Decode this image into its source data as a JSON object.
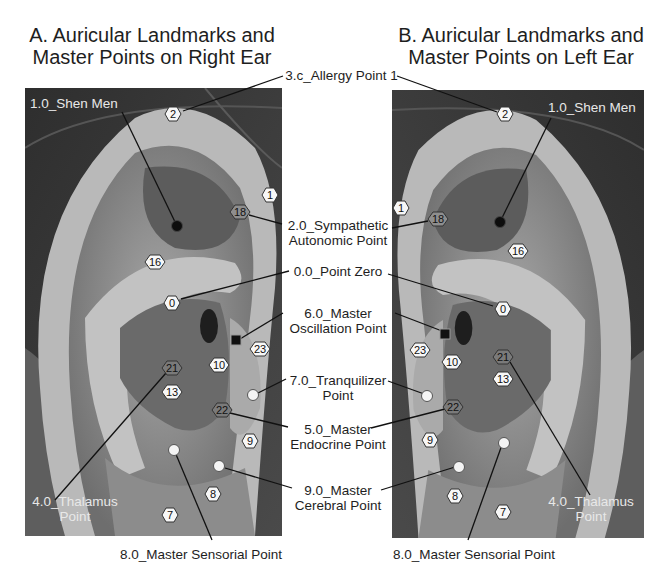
{
  "titles": {
    "a_line1": "A. Auricular Landmarks and",
    "a_line2": "Master Points on Right Ear",
    "b_line1": "B. Auricular Landmarks and",
    "b_line2": "Master Points on Left Ear"
  },
  "center_labels": {
    "allergy": "3.c_Allergy Point 1",
    "sympathetic_1": "2.0_Sympathetic",
    "sympathetic_2": "Autonomic Point",
    "point_zero": "0.0_Point Zero",
    "oscillation_1": "6.0_Master",
    "oscillation_2": "Oscillation Point",
    "tranquilizer_1": "7.0_Tranquilizer",
    "tranquilizer_2": "Point",
    "endocrine_1": "5.0_Master",
    "endocrine_2": "Endocrine Point",
    "cerebral_1": "9.0_Master",
    "cerebral_2": "Cerebral Point"
  },
  "panel_a": {
    "shen_men": "1.0_Shen Men",
    "thalamus_1": "4.0_Thalamus",
    "thalamus_2": "Point",
    "sensorial": "8.0_Master Sensorial Point"
  },
  "panel_b": {
    "shen_men": "1.0_Shen Men",
    "thalamus_1": "4.0_Thalamus",
    "thalamus_2": "Point",
    "sensorial": "8.0_Master Sensorial Point"
  },
  "hex_markers_a": [
    {
      "n": "2",
      "x": 173,
      "y": 114,
      "style": "light"
    },
    {
      "n": "1",
      "x": 270,
      "y": 195,
      "style": "light"
    },
    {
      "n": "18",
      "x": 240,
      "y": 212,
      "style": "dark"
    },
    {
      "n": "16",
      "x": 155,
      "y": 262,
      "style": "light"
    },
    {
      "n": "0",
      "x": 172,
      "y": 303,
      "style": "light"
    },
    {
      "n": "23",
      "x": 260,
      "y": 349,
      "style": "light"
    },
    {
      "n": "10",
      "x": 219,
      "y": 365,
      "style": "light"
    },
    {
      "n": "21",
      "x": 172,
      "y": 368,
      "style": "dark"
    },
    {
      "n": "13",
      "x": 172,
      "y": 392,
      "style": "light"
    },
    {
      "n": "22",
      "x": 222,
      "y": 410,
      "style": "dark"
    },
    {
      "n": "9",
      "x": 250,
      "y": 441,
      "style": "light"
    },
    {
      "n": "8",
      "x": 213,
      "y": 494,
      "style": "light"
    },
    {
      "n": "7",
      "x": 170,
      "y": 515,
      "style": "light"
    }
  ],
  "hex_markers_b": [
    {
      "n": "2",
      "x": 505,
      "y": 114,
      "style": "light"
    },
    {
      "n": "1",
      "x": 401,
      "y": 208,
      "style": "light"
    },
    {
      "n": "18",
      "x": 438,
      "y": 219,
      "style": "dark"
    },
    {
      "n": "16",
      "x": 518,
      "y": 251,
      "style": "light"
    },
    {
      "n": "0",
      "x": 503,
      "y": 309,
      "style": "light"
    },
    {
      "n": "23",
      "x": 420,
      "y": 350,
      "style": "light"
    },
    {
      "n": "10",
      "x": 452,
      "y": 362,
      "style": "light"
    },
    {
      "n": "21",
      "x": 503,
      "y": 357,
      "style": "dark"
    },
    {
      "n": "13",
      "x": 503,
      "y": 379,
      "style": "light"
    },
    {
      "n": "22",
      "x": 453,
      "y": 407,
      "style": "dark"
    },
    {
      "n": "9",
      "x": 430,
      "y": 440,
      "style": "light"
    },
    {
      "n": "8",
      "x": 455,
      "y": 496,
      "style": "light"
    },
    {
      "n": "7",
      "x": 503,
      "y": 512,
      "style": "light"
    }
  ]
}
